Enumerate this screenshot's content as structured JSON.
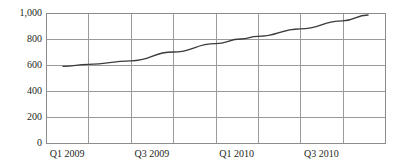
{
  "chart_data": {
    "type": "line",
    "title": "",
    "subtitle": "",
    "xlabel": "",
    "ylabel": "",
    "ylim": [
      0,
      1000
    ],
    "ytick_values": [
      0,
      200,
      400,
      600,
      800,
      1000
    ],
    "ytick_labels": [
      "0",
      "200",
      "400",
      "600",
      "800",
      "1,000"
    ],
    "categories": [
      "Q1 2009",
      "Q2 2009",
      "Q3 2009",
      "Q4 2009",
      "Q1 2010",
      "Q2 2010",
      "Q3 2010",
      "Q4 2010"
    ],
    "xtick_labels": [
      "Q1 2009",
      "Q3 2009",
      "Q1 2010",
      "Q3 2010"
    ],
    "xtick_label_columns": [
      1,
      3,
      5,
      7
    ],
    "grid": true,
    "grid_vertical_count": 7,
    "grid_horizontal_count": 4,
    "legend": false,
    "legend_position": "none",
    "series": [
      {
        "name": "",
        "color": "#3b3b3b",
        "x": [
          0.4,
          1.0,
          2.0,
          3.0,
          4.0,
          4.6,
          5.0,
          6.0,
          7.0,
          7.6
        ],
        "values": [
          590,
          605,
          632,
          700,
          765,
          800,
          820,
          878,
          940,
          985
        ],
        "points": [
          {
            "x": 0.4,
            "y": 590
          },
          {
            "x": 1.0,
            "y": 605
          },
          {
            "x": 2.0,
            "y": 632
          },
          {
            "x": 3.0,
            "y": 700
          },
          {
            "x": 4.0,
            "y": 765
          },
          {
            "x": 4.6,
            "y": 800
          },
          {
            "x": 5.0,
            "y": 820
          },
          {
            "x": 6.0,
            "y": 878
          },
          {
            "x": 7.0,
            "y": 940
          },
          {
            "x": 7.6,
            "y": 985
          }
        ]
      }
    ],
    "plot_area": {
      "left": 46,
      "top": 13,
      "right": 385,
      "bottom": 143
    },
    "colors": {
      "line": "#3b3b3b",
      "grid": "#9a9a9a",
      "frame": "#8c8c8c",
      "text": "#231f20",
      "background": "#ffffff"
    }
  }
}
